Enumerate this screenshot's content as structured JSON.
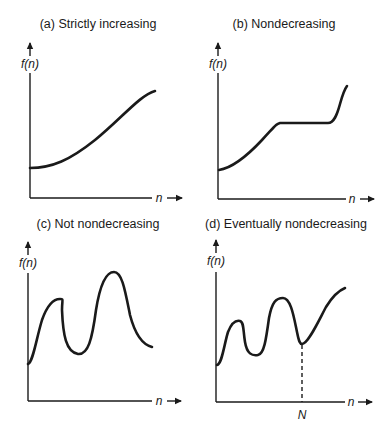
{
  "panels": [
    {
      "id": "a",
      "title": "(a) Strictly increasing",
      "y_label": "f(n)",
      "x_label": "n",
      "curve_description": "smooth strictly increasing S-like curve"
    },
    {
      "id": "b",
      "title": "(b) Nondecreasing",
      "y_label": "f(n)",
      "x_label": "n",
      "curve_description": "rises, flat plateau, then rises steeply"
    },
    {
      "id": "c",
      "title": "(c) Not nondecreasing",
      "y_label": "f(n)",
      "x_label": "n",
      "curve_description": "oscillating curve with two peaks, ending lower"
    },
    {
      "id": "d",
      "title": "(d) Eventually nondecreasing",
      "y_label": "f(n)",
      "x_label": "n",
      "marker_label": "N",
      "curve_description": "oscillates then increases after point N (dashed vertical line)"
    }
  ],
  "colors": {
    "ink": "#1a1a1a",
    "background": "#ffffff"
  }
}
